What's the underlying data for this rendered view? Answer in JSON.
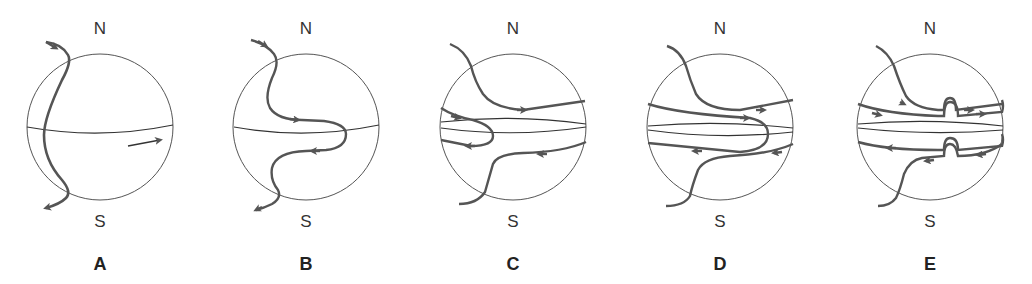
{
  "figure": {
    "panels": [
      {
        "id": "A",
        "label": "A",
        "north": "N",
        "south": "S",
        "cx": 100
      },
      {
        "id": "B",
        "label": "B",
        "north": "N",
        "south": "S",
        "cx": 306
      },
      {
        "id": "C",
        "label": "C",
        "north": "N",
        "south": "S",
        "cx": 513
      },
      {
        "id": "D",
        "label": "D",
        "north": "N",
        "south": "S",
        "cx": 722
      },
      {
        "id": "E",
        "label": "E",
        "north": "N",
        "south": "S",
        "cx": 930
      }
    ]
  },
  "colors": {
    "sphere_outline": "#555555",
    "field_line": "#555555",
    "text": "#333333"
  }
}
